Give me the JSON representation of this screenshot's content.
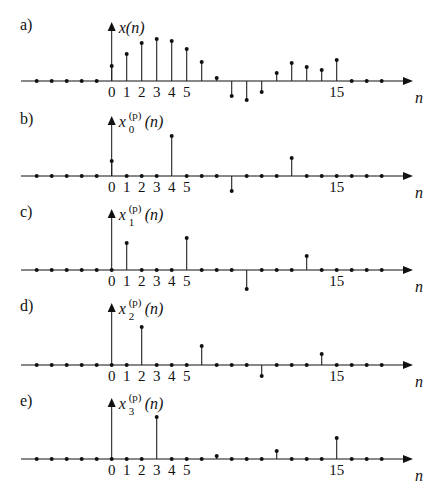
{
  "chart_data": [
    {
      "type": "stem",
      "panel": "a)",
      "ylabel": "x(n)",
      "ylabel_parts": {
        "base": "x",
        "sup": "",
        "sub": "",
        "arg": "(n)"
      },
      "xlabel": "n",
      "tick_labels": [
        "0",
        "1",
        "2",
        "3",
        "4",
        "5",
        "15"
      ],
      "x": [
        -5,
        -4,
        -3,
        -2,
        -1,
        0,
        1,
        2,
        3,
        4,
        5,
        6,
        7,
        8,
        9,
        10,
        11,
        12,
        13,
        14,
        15,
        16,
        17,
        18
      ],
      "values": [
        0,
        0,
        0,
        0,
        0,
        15,
        27,
        38,
        42,
        40,
        32,
        19,
        3,
        -15,
        -19,
        -11,
        8,
        18,
        14,
        11,
        21,
        0,
        0,
        0
      ]
    },
    {
      "type": "stem",
      "panel": "b)",
      "ylabel": "x_0^(p)(n)",
      "ylabel_parts": {
        "base": "x",
        "sup": "(p)",
        "sub": "0",
        "arg": "(n)"
      },
      "xlabel": "n",
      "tick_labels": [
        "0",
        "1",
        "2",
        "3",
        "4",
        "5",
        "15"
      ],
      "x": [
        -5,
        -4,
        -3,
        -2,
        -1,
        0,
        1,
        2,
        3,
        4,
        5,
        6,
        7,
        8,
        9,
        10,
        11,
        12,
        13,
        14,
        15,
        16,
        17,
        18
      ],
      "values": [
        0,
        0,
        0,
        0,
        0,
        15,
        0,
        0,
        0,
        40,
        0,
        0,
        0,
        -15,
        0,
        0,
        0,
        18,
        0,
        0,
        0,
        0,
        0,
        0
      ]
    },
    {
      "type": "stem",
      "panel": "c)",
      "ylabel": "x_1^(p)(n)",
      "ylabel_parts": {
        "base": "x",
        "sup": "(p)",
        "sub": "1",
        "arg": "(n)"
      },
      "xlabel": "n",
      "tick_labels": [
        "0",
        "1",
        "2",
        "3",
        "4",
        "5",
        "15"
      ],
      "x": [
        -5,
        -4,
        -3,
        -2,
        -1,
        0,
        1,
        2,
        3,
        4,
        5,
        6,
        7,
        8,
        9,
        10,
        11,
        12,
        13,
        14,
        15,
        16,
        17,
        18
      ],
      "values": [
        0,
        0,
        0,
        0,
        0,
        0,
        27,
        0,
        0,
        0,
        32,
        0,
        0,
        0,
        -19,
        0,
        0,
        0,
        14,
        0,
        0,
        0,
        0,
        0
      ]
    },
    {
      "type": "stem",
      "panel": "d)",
      "ylabel": "x_2^(p)(n)",
      "ylabel_parts": {
        "base": "x",
        "sup": "(p)",
        "sub": "2",
        "arg": "(n)"
      },
      "xlabel": "n",
      "tick_labels": [
        "0",
        "1",
        "2",
        "3",
        "4",
        "5",
        "15"
      ],
      "x": [
        -5,
        -4,
        -3,
        -2,
        -1,
        0,
        1,
        2,
        3,
        4,
        5,
        6,
        7,
        8,
        9,
        10,
        11,
        12,
        13,
        14,
        15,
        16,
        17,
        18
      ],
      "values": [
        0,
        0,
        0,
        0,
        0,
        0,
        0,
        38,
        0,
        0,
        0,
        19,
        0,
        0,
        0,
        -11,
        0,
        0,
        0,
        11,
        0,
        0,
        0,
        0
      ]
    },
    {
      "type": "stem",
      "panel": "e)",
      "ylabel": "x_3^(p)(n)",
      "ylabel_parts": {
        "base": "x",
        "sup": "(p)",
        "sub": "3",
        "arg": "(n)"
      },
      "xlabel": "n",
      "tick_labels": [
        "0",
        "1",
        "2",
        "3",
        "4",
        "5",
        "15"
      ],
      "x": [
        -5,
        -4,
        -3,
        -2,
        -1,
        0,
        1,
        2,
        3,
        4,
        5,
        6,
        7,
        8,
        9,
        10,
        11,
        12,
        13,
        14,
        15,
        16,
        17,
        18
      ],
      "values": [
        0,
        0,
        0,
        0,
        0,
        0,
        0,
        0,
        42,
        0,
        0,
        0,
        3,
        0,
        0,
        0,
        8,
        0,
        0,
        0,
        21,
        0,
        0,
        0
      ]
    }
  ],
  "layout": {
    "axis_y": [
      81,
      176,
      270,
      365,
      459
    ],
    "yaxis_top": [
      22,
      116,
      209,
      303,
      398
    ],
    "x0_px": 111.7,
    "dx_px": 15,
    "axis_left": 21,
    "axis_right": 413,
    "ink_color": "#111111"
  }
}
